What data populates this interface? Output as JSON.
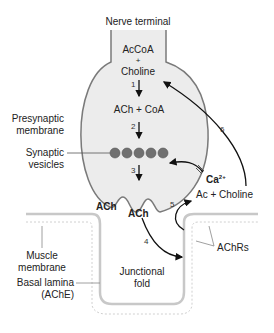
{
  "title": "Nerve terminal",
  "steps": {
    "s1": "1",
    "s2": "2",
    "s3": "3",
    "s4": "4",
    "s5": "5",
    "s6": "6"
  },
  "labels": {
    "accoa": "AcCoA",
    "plus": "+",
    "choline": "Choline",
    "ach_coa": "ACh + CoA",
    "presynaptic1": "Presynaptic",
    "presynaptic2": "membrane",
    "synaptic1": "Synaptic",
    "synaptic2": "vesicles",
    "ca": "Ca",
    "ca_sup": "2+",
    "ac_choline": "Ac + Choline",
    "ach_left": "ACh",
    "ach_right": "ACh",
    "muscle1": "Muscle",
    "muscle2": "membrane",
    "junctional1": "Junctional",
    "junctional2": "fold",
    "basal1": "Basal lamina",
    "basal2": "(AChE)",
    "achrs": "AChRs"
  },
  "colors": {
    "membrane": "#7a7a7a",
    "terminal_fill": "#ececec",
    "vesicle": "#707070",
    "muscle": "#c8c8c8",
    "arrow": "#111111"
  }
}
